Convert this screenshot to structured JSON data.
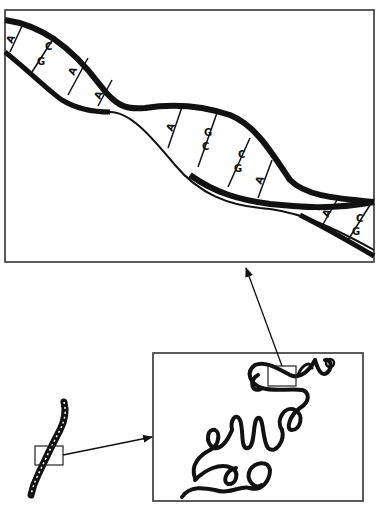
{
  "diagram": {
    "colors": {
      "ink": "#111111",
      "frame": "#333333",
      "background": "#ffffff"
    },
    "panels": {
      "helix_panel": {
        "label": "DNA double helix (magnified)"
      },
      "chromatin_panel": {
        "label": "Coiled chromatin fiber (magnified)"
      },
      "chromosome": {
        "label": "Chromosome"
      }
    },
    "base_pairs": [
      {
        "top": "A",
        "bottom": "T"
      },
      {
        "top": "C",
        "bottom": "G"
      },
      {
        "top": "A",
        "bottom": "T"
      },
      {
        "top": "A",
        "bottom": "T"
      },
      {
        "top": "A",
        "bottom": "T"
      },
      {
        "top": "G",
        "bottom": "C"
      },
      {
        "top": "C",
        "bottom": "G"
      },
      {
        "top": "T",
        "bottom": "A"
      },
      {
        "top": "A",
        "bottom": "T"
      },
      {
        "top": "C",
        "bottom": "G"
      }
    ],
    "arrows": [
      {
        "from": "chromosome-box",
        "to": "chromatin-panel"
      },
      {
        "from": "chromatin-box",
        "to": "helix-panel"
      }
    ]
  }
}
